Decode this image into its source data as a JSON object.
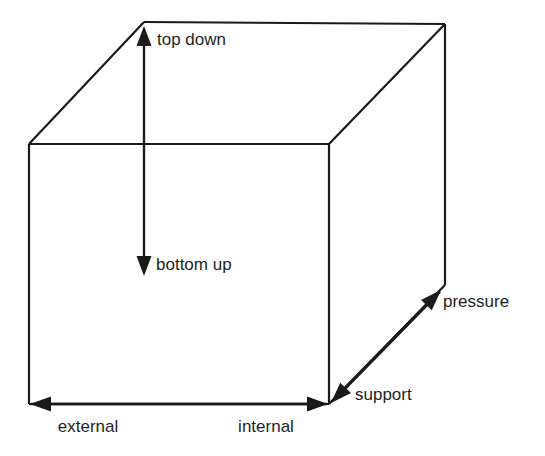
{
  "diagram": {
    "background_color": "#ffffff",
    "line_color": "#1a1a1a",
    "text_color": "#1f1f1f",
    "edge_width": 2.2,
    "axis_width": 2.4,
    "label_font_size": 17,
    "cube": {
      "front_top_left": {
        "x": 29,
        "y": 144
      },
      "front_top_right": {
        "x": 329,
        "y": 144
      },
      "front_bottom_left": {
        "x": 29,
        "y": 404
      },
      "front_bottom_right": {
        "x": 329,
        "y": 404
      },
      "back_top_left": {
        "x": 144,
        "y": 22
      },
      "back_top_right": {
        "x": 445,
        "y": 24
      },
      "back_bottom_right": {
        "x": 445,
        "y": 285
      },
      "edges": [
        {
          "name": "front-face-top",
          "x1": 29,
          "y1": 144,
          "x2": 329,
          "y2": 144
        },
        {
          "name": "front-face-left",
          "x1": 29,
          "y1": 144,
          "x2": 29,
          "y2": 404
        },
        {
          "name": "front-face-bottom",
          "x1": 29,
          "y1": 404,
          "x2": 329,
          "y2": 404
        },
        {
          "name": "front-face-right",
          "x1": 329,
          "y1": 144,
          "x2": 329,
          "y2": 404
        },
        {
          "name": "back-face-top",
          "x1": 144,
          "y1": 22,
          "x2": 445,
          "y2": 24
        },
        {
          "name": "back-face-right",
          "x1": 445,
          "y1": 24,
          "x2": 445,
          "y2": 285
        },
        {
          "name": "diagonal-top-left",
          "x1": 29,
          "y1": 144,
          "x2": 144,
          "y2": 22
        },
        {
          "name": "diagonal-top-right",
          "x1": 329,
          "y1": 144,
          "x2": 445,
          "y2": 24
        },
        {
          "name": "right-face-bottom",
          "x1": 329,
          "y1": 404,
          "x2": 445,
          "y2": 285
        }
      ]
    },
    "axes": [
      {
        "id": "top-down",
        "label": "top down",
        "label_x": 157,
        "label_y": 41,
        "label_anchor": "start",
        "direction": "up",
        "line": {
          "x1": 144,
          "y1": 146,
          "x2": 144,
          "y2": 40
        },
        "arrow": {
          "tip_x": 144,
          "tip_y": 26,
          "angle_deg": -90,
          "length": 20,
          "half_width": 7.5
        }
      },
      {
        "id": "bottom-up",
        "label": "bottom up",
        "label_x": 156,
        "label_y": 266,
        "label_anchor": "start",
        "direction": "down",
        "line": {
          "x1": 144,
          "y1": 146,
          "x2": 144,
          "y2": 258
        },
        "arrow": {
          "tip_x": 144,
          "tip_y": 276,
          "angle_deg": 90,
          "length": 20,
          "half_width": 7.5
        }
      },
      {
        "id": "external",
        "label": "external",
        "label_x": 88,
        "label_y": 428,
        "label_anchor": "middle",
        "direction": "left",
        "line": {
          "x1": 327,
          "y1": 404,
          "x2": 47,
          "y2": 404
        },
        "arrow": {
          "tip_x": 30,
          "tip_y": 404,
          "angle_deg": 180,
          "length": 21,
          "half_width": 7.5
        }
      },
      {
        "id": "internal",
        "label": "internal",
        "label_x": 266,
        "label_y": 428,
        "label_anchor": "middle",
        "direction": "right",
        "line": {
          "x1": 31,
          "y1": 404,
          "x2": 310,
          "y2": 404
        },
        "arrow": {
          "tip_x": 328,
          "tip_y": 404,
          "angle_deg": 0,
          "length": 21,
          "half_width": 7.5
        }
      },
      {
        "id": "support",
        "label": "support",
        "label_x": 355,
        "label_y": 396,
        "label_anchor": "start",
        "direction": "down-left",
        "line": {
          "x1": 440,
          "y1": 292,
          "x2": 345,
          "y2": 389
        },
        "arrow": {
          "tip_x": 331,
          "tip_y": 403,
          "angle_deg": 134,
          "length": 21,
          "half_width": 7.5
        }
      },
      {
        "id": "pressure",
        "label": "pressure",
        "label_x": 443,
        "label_y": 303,
        "label_anchor": "start",
        "direction": "up-right",
        "line": {
          "x1": 331,
          "y1": 402,
          "x2": 426,
          "y2": 305
        },
        "arrow": {
          "tip_x": 441,
          "tip_y": 290,
          "angle_deg": -46,
          "length": 21,
          "half_width": 7.5
        }
      }
    ]
  }
}
